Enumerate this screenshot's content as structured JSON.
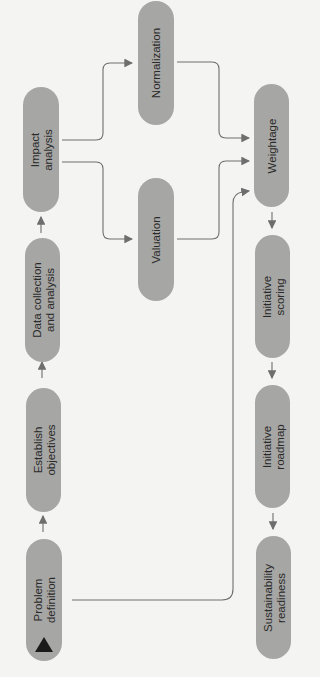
{
  "diagram": {
    "type": "flowchart",
    "orientation": "rotated-90-ccw",
    "nodes": [
      {
        "id": "problem",
        "line1": "Problem",
        "line2": "definition"
      },
      {
        "id": "establish",
        "line1": "Establish",
        "line2": "objectives"
      },
      {
        "id": "data",
        "line1": "Data collection",
        "line2": "and analysis"
      },
      {
        "id": "impact",
        "line1": "Impact",
        "line2": "analysis"
      },
      {
        "id": "valuation",
        "line1": "Valuation",
        "line2": ""
      },
      {
        "id": "normalization",
        "line1": "Normalization",
        "line2": ""
      },
      {
        "id": "weightage",
        "line1": "Weightage",
        "line2": ""
      },
      {
        "id": "scoring",
        "line1": "Initiative",
        "line2": "scoring"
      },
      {
        "id": "roadmap",
        "line1": "Initiative",
        "line2": "roadmap"
      },
      {
        "id": "readiness",
        "line1": "Sustainability",
        "line2": "readiness"
      }
    ],
    "edges": [
      {
        "from": "problem",
        "to": "establish"
      },
      {
        "from": "establish",
        "to": "data"
      },
      {
        "from": "data",
        "to": "impact"
      },
      {
        "from": "impact",
        "to": "normalization"
      },
      {
        "from": "impact",
        "to": "valuation"
      },
      {
        "from": "normalization",
        "to": "weightage"
      },
      {
        "from": "valuation",
        "to": "weightage"
      },
      {
        "from": "problem",
        "to": "weightage"
      },
      {
        "from": "weightage",
        "to": "scoring"
      },
      {
        "from": "scoring",
        "to": "roadmap"
      },
      {
        "from": "roadmap",
        "to": "readiness"
      }
    ],
    "colors": {
      "node": "#a6a6a4",
      "edge": "#6e6e6e",
      "marker": "#1a1a1a",
      "background": "#f4f4f2"
    }
  }
}
